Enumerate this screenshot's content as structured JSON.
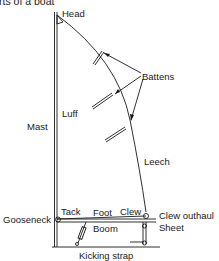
{
  "title": "rts of a boat",
  "labels": {
    "head": "Head",
    "battens": "Battens",
    "mast": "Mast",
    "luff": "Luff",
    "leech": "Leech",
    "tack": "Tack",
    "foot": "Foot",
    "clew": "Clew",
    "gooseneck": "Gooseneck",
    "clew_outhaul": "Clew outhaul",
    "sheet": "Sheet",
    "boom": "Boom",
    "kicking_strap": "Kicking strap"
  },
  "colors": {
    "ink": "#1a1a1a",
    "background": "#ffffff"
  }
}
